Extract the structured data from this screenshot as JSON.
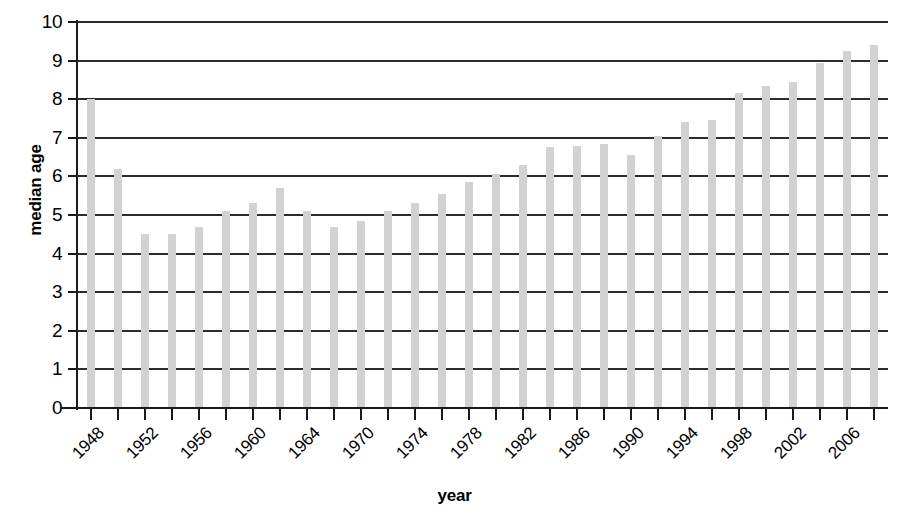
{
  "chart_data": {
    "type": "bar",
    "title": "",
    "xlabel": "year",
    "ylabel": "median age",
    "ylim": [
      0,
      10
    ],
    "ytick_step": 1,
    "yticks": [
      "0",
      "1",
      "2",
      "3",
      "4",
      "5",
      "6",
      "7",
      "8",
      "9",
      "10"
    ],
    "grid": "horizontal",
    "legend": "none",
    "bar_color": "#d2d2d2",
    "axis_color": "#1a1a1a",
    "gridline_color": "#2b2b2b",
    "categories": [
      "1948",
      "1950",
      "1952",
      "1954",
      "1956",
      "1958",
      "1960",
      "1962",
      "1964",
      "1970",
      "1972",
      "1974",
      "1976",
      "1978",
      "1980",
      "1982",
      "1984",
      "1986",
      "1988",
      "1990",
      "1992",
      "1994",
      "1996",
      "1998",
      "2000",
      "2002",
      "2004",
      "2006",
      "2008"
    ],
    "values": [
      8.0,
      6.2,
      4.5,
      4.5,
      4.7,
      5.1,
      5.3,
      5.7,
      5.1,
      4.7,
      4.85,
      5.1,
      5.3,
      5.55,
      5.85,
      6.05,
      6.3,
      6.75,
      6.8,
      6.85,
      6.55,
      7.05,
      7.4,
      7.45,
      8.15,
      8.35,
      8.45,
      8.95,
      9.25
    ],
    "extra_bar": {
      "label": "2008",
      "value": 9.4
    },
    "xtick_labels": [
      "1948",
      "1952",
      "1956",
      "1960",
      "1964",
      "1970",
      "1974",
      "1978",
      "1982",
      "1986",
      "1990",
      "1994",
      "1998",
      "2002",
      "2006"
    ],
    "xtick_label_interval": 2,
    "n_bars": 30,
    "n_xticks": 30
  }
}
